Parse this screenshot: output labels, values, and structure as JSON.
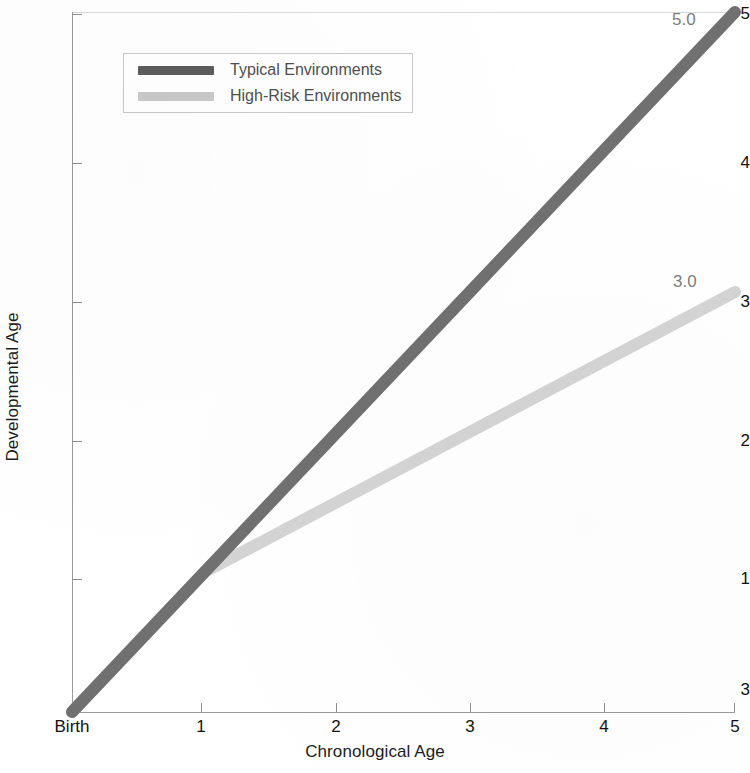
{
  "chart_data": {
    "type": "line",
    "title": "",
    "xlabel": "Chronological Age",
    "ylabel": "Developmental Age",
    "xlim": [
      0,
      5
    ],
    "ylim": [
      0,
      5
    ],
    "grid": false,
    "legend_position": "upper-left-inside",
    "x_tick_labels": [
      "Birth",
      "1",
      "2",
      "3",
      "4",
      "5"
    ],
    "x_tick_values": [
      0,
      1,
      2,
      3,
      4,
      5
    ],
    "y_tick_labels": [
      "3",
      "1",
      "2",
      "3",
      "4",
      "5"
    ],
    "y_tick_values": [
      0,
      1,
      2,
      3,
      4,
      5
    ],
    "series": [
      {
        "name": "Typical Environments",
        "color": "#707070",
        "x": [
          0,
          1,
          2,
          3,
          4,
          5
        ],
        "values": [
          0,
          1,
          2,
          3,
          4,
          5
        ],
        "end_label": "5.0"
      },
      {
        "name": "High-Risk Environments",
        "color": "#d4d4d4",
        "x": [
          0,
          1,
          2,
          3,
          4,
          5
        ],
        "values": [
          0,
          1,
          1.5,
          2,
          2.5,
          3
        ],
        "end_label": "3.0"
      }
    ],
    "annotations": [
      {
        "text": "5.0",
        "series": "Typical Environments"
      },
      {
        "text": "3.0",
        "series": "High-Risk Environments"
      }
    ]
  },
  "axes": {
    "y_title": "Developmental Age",
    "x_title": "Chronological Age",
    "y_ticks": [
      {
        "label": "5"
      },
      {
        "label": "4"
      },
      {
        "label": "3"
      },
      {
        "label": "2"
      },
      {
        "label": "1"
      },
      {
        "label": "3"
      }
    ],
    "x_ticks": [
      {
        "label": "Birth"
      },
      {
        "label": "1"
      },
      {
        "label": "2"
      },
      {
        "label": "3"
      },
      {
        "label": "4"
      },
      {
        "label": "5"
      }
    ]
  },
  "legend": {
    "entries": [
      {
        "label": "Typical Environments",
        "color": "#5c5c5c"
      },
      {
        "label": "High-Risk Environments",
        "color": "#c9c9c9"
      }
    ]
  },
  "value_labels": {
    "typical": "5.0",
    "high_risk": "3.0"
  },
  "colors": {
    "typical_line": "#707070",
    "high_risk_line": "#d4d4d4",
    "axis": "#9a9a9a",
    "text": "#111111",
    "value_label_text": "#7d7d7d"
  }
}
